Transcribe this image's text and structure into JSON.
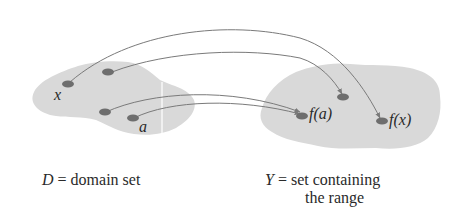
{
  "diagram": {
    "domain_set": {
      "points": [
        {
          "id": "x",
          "label": "x",
          "labeled": true
        },
        {
          "id": "p2",
          "label": "",
          "labeled": false
        },
        {
          "id": "p3",
          "label": "",
          "labeled": false
        },
        {
          "id": "a",
          "label": "a",
          "labeled": true
        }
      ],
      "caption_symbol": "D",
      "caption_eq": " = ",
      "caption_text": "domain set"
    },
    "codomain_set": {
      "points": [
        {
          "id": "fa",
          "label": "f(a)",
          "labeled": true
        },
        {
          "id": "q2",
          "label": "",
          "labeled": false
        },
        {
          "id": "fx",
          "label": "f(x)",
          "labeled": true
        }
      ],
      "caption_symbol": "Y",
      "caption_eq": " = ",
      "caption_line1": "set containing",
      "caption_line2": "the range"
    },
    "mappings": [
      {
        "from": "x",
        "to": "f(x)"
      },
      {
        "from": "p2",
        "to": "q2"
      },
      {
        "from": "p3",
        "to": "f(a)"
      },
      {
        "from": "a",
        "to": "f(a)"
      }
    ],
    "colors": {
      "blob": "#d9d9d9",
      "dot": "#6e6e6e",
      "arrow": "#7a7a7a",
      "text": "#2a2a2a"
    }
  }
}
